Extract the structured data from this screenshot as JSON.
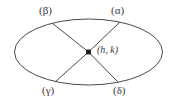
{
  "figure": {
    "type": "ellipse-with-chords",
    "background_color": "#ffffff",
    "stroke_color": "#4a4a4a",
    "text_color": "#3a3a3a",
    "ellipse": {
      "cx": 88.5,
      "cy": 52,
      "rx": 74,
      "ry": 33
    },
    "center_point": {
      "label": "(h, k)",
      "x": 88.5,
      "y": 52,
      "dot_radius": 2.4
    },
    "vertices": [
      {
        "id": "alpha",
        "label": "(α)",
        "x": 120,
        "y": 22,
        "label_x": 111,
        "label_y": 5
      },
      {
        "id": "beta",
        "label": "(β)",
        "x": 52,
        "y": 23,
        "label_x": 39,
        "label_y": 5
      },
      {
        "id": "gamma",
        "label": "(γ)",
        "x": 55,
        "y": 82,
        "label_x": 42,
        "label_y": 85
      },
      {
        "id": "delta",
        "label": "(δ)",
        "x": 118,
        "y": 82,
        "label_x": 113,
        "label_y": 85
      }
    ],
    "chords": [
      {
        "id": "chord-center-alpha",
        "from": "center",
        "to": "alpha"
      },
      {
        "id": "chord-center-beta",
        "from": "center",
        "to": "beta"
      },
      {
        "id": "chord-center-gamma",
        "from": "center",
        "to": "gamma"
      },
      {
        "id": "chord-center-delta",
        "from": "center",
        "to": "delta"
      }
    ]
  }
}
